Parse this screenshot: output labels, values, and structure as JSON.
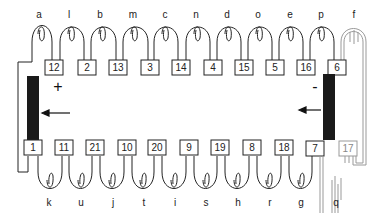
{
  "diagram": {
    "top_labels": [
      "a",
      "l",
      "b",
      "m",
      "c",
      "n",
      "d",
      "o",
      "e",
      "p",
      "f"
    ],
    "top_boxes": [
      "12",
      "2",
      "13",
      "3",
      "14",
      "4",
      "15",
      "5",
      "16",
      "6"
    ],
    "bottom_labels": [
      "k",
      "u",
      "j",
      "t",
      "i",
      "s",
      "h",
      "r",
      "g",
      "q"
    ],
    "bottom_boxes": [
      "1",
      "11",
      "21",
      "10",
      "20",
      "9",
      "19",
      "8",
      "18",
      "7",
      "17"
    ],
    "left_electrode": {
      "sign": "+",
      "color": "#1a1a1a"
    },
    "right_electrode": {
      "sign": "-",
      "color": "#1a1a1a"
    },
    "wire_color": "#222222",
    "ghost_color": "#999999"
  }
}
